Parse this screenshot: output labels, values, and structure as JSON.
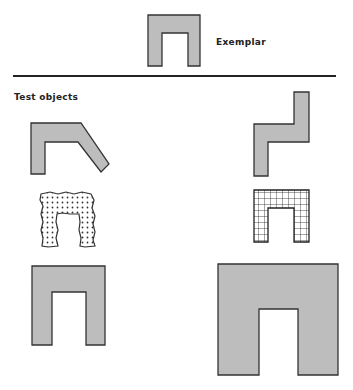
{
  "exemplar": {
    "label": "Exemplar"
  },
  "test_section": {
    "label": "Test objects"
  },
  "colors": {
    "fill": "#bdbdbd",
    "stroke": "#333333",
    "background": "#ffffff"
  },
  "shapes": [
    {
      "id": "exemplar",
      "description": "arch (inverted U) shape, gray fill"
    },
    {
      "id": "bent-arch",
      "description": "arch with one leg bent diagonally"
    },
    {
      "id": "zigzag",
      "description": "Z/step shape rearranged parts"
    },
    {
      "id": "dotted-arch",
      "description": "arch with rough outline and dotted texture"
    },
    {
      "id": "grid-arch",
      "description": "arch with grid texture"
    },
    {
      "id": "small-arch",
      "description": "arch, same shape gray"
    },
    {
      "id": "large-arch",
      "description": "larger arch, gray"
    }
  ]
}
